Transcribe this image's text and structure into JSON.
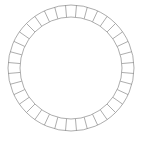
{
  "figure": {
    "name": "segmented-ring",
    "background_color": "#ffffff",
    "stroke_color": "#8a8a8a",
    "stroke_width": 0.7,
    "center_x": 71,
    "center_y": 68,
    "outer_radius": 63,
    "inner_radius": 51,
    "segment_count": 36,
    "start_angle_deg": -95
  },
  "caption": {
    "text": "",
    "visible": true,
    "color": "#cfcfcf"
  }
}
